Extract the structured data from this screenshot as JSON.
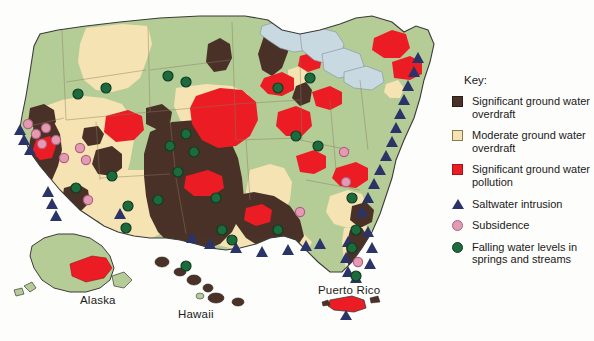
{
  "map": {
    "title_labels": [
      {
        "id": "alaska",
        "text": "Alaska"
      },
      {
        "id": "hawaii",
        "text": "Hawaii"
      },
      {
        "id": "puerto_rico",
        "text": "Puerto Rico"
      }
    ],
    "colors": {
      "background": "#fdfdfb",
      "base_land_green": "#b5cc96",
      "moderate_overdraft_tan": "#f5e3b3",
      "significant_overdraft_brown": "#4a3228",
      "significant_pollution_red": "#ec1c24",
      "lakes_blue": "#c9d9e2",
      "outline": "#3b3b3b",
      "saltwater_triangle_navy": "#2b3468",
      "subsidence_pink": "#e59ab4",
      "subsidence_pink_outline": "#b06080",
      "falling_levels_green": "#1d6b3c",
      "falling_levels_green_outline": "#0f3d22"
    }
  },
  "legend": {
    "title": "Key:",
    "items": [
      {
        "marker": "swatch-dark-brown",
        "label": "Significant ground water overdraft"
      },
      {
        "marker": "swatch-tan",
        "label": "Moderate ground water overdraft"
      },
      {
        "marker": "swatch-red",
        "label": "Significant ground water pollution"
      },
      {
        "marker": "triangle-navy",
        "label": "Saltwater intrusion"
      },
      {
        "marker": "circle-pink",
        "label": "Subsidence"
      },
      {
        "marker": "circle-green",
        "label": "Falling water levels in springs and streams"
      }
    ]
  }
}
